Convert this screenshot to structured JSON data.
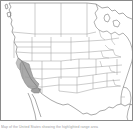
{
  "map": {
    "title": "United States outline map",
    "region": "Contiguous United States (western and central focus)",
    "projection_note": "state boundary outline, no labels",
    "background_color": "#ffffff",
    "border_color": "#8a8a8a",
    "state_line_color": "#9a9a9a",
    "coast_line_color": "#6f6f6f",
    "highlight_color": "#969696",
    "highlighted_regions": [
      "California",
      "Southern California / coastal range"
    ]
  },
  "caption": {
    "text": "Map of the United States showing the highlighted range area"
  }
}
